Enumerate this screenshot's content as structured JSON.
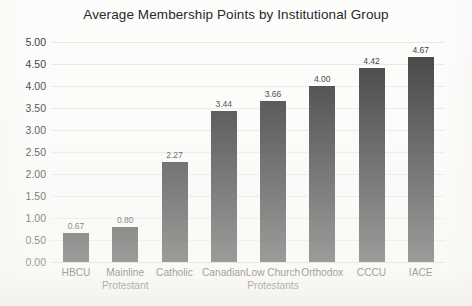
{
  "chart_data": {
    "type": "bar",
    "title": "Average Membership Points by Institutional Group",
    "xlabel": "",
    "ylabel": "",
    "ylim": [
      0,
      5
    ],
    "ytick_step": 0.5,
    "grid": true,
    "legend": "none",
    "bar_color": "#333333",
    "background_color": "#fdfdfc",
    "gridline_color": "#e9e8e4",
    "value_label_format": "0.00",
    "ytick_labels": [
      "5.00",
      "4.50",
      "4.00",
      "3.50",
      "3.00",
      "2.50",
      "2.00",
      "1.50",
      "1.00",
      "0.50",
      "0.00"
    ],
    "ytick_values": [
      5,
      4.5,
      4,
      3.5,
      3,
      2.5,
      2,
      1.5,
      1,
      0.5,
      0
    ],
    "categories": [
      "HBCU",
      "Mainline Protestant",
      "Catholic",
      "Canadian",
      "Low Church Protestants",
      "Orthodox",
      "CCCU",
      "IACE"
    ],
    "category_lines": [
      [
        "HBCU",
        ""
      ],
      [
        "Mainline",
        "Protestant"
      ],
      [
        "Catholic",
        ""
      ],
      [
        "Canadian",
        ""
      ],
      [
        "Low Church",
        "Protestants"
      ],
      [
        "Orthodox",
        ""
      ],
      [
        "CCCU",
        ""
      ],
      [
        "IACE",
        ""
      ]
    ],
    "values": [
      0.67,
      0.8,
      2.27,
      3.44,
      3.66,
      4.0,
      4.42,
      4.67
    ],
    "value_labels": [
      "0.67",
      "0.80",
      "2.27",
      "3.44",
      "3.66",
      "4.00",
      "4.42",
      "4.67"
    ]
  }
}
